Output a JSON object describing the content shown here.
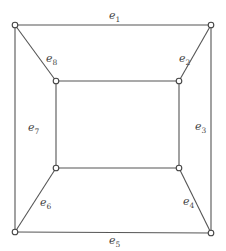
{
  "diagram": {
    "type": "graph",
    "vertices": [
      {
        "id": "outer-top-left",
        "x": 15,
        "y": 25
      },
      {
        "id": "outer-top-right",
        "x": 211,
        "y": 25
      },
      {
        "id": "outer-bottom-right",
        "x": 211,
        "y": 233
      },
      {
        "id": "outer-bottom-left",
        "x": 15,
        "y": 232
      },
      {
        "id": "inner-top-left",
        "x": 56,
        "y": 81
      },
      {
        "id": "inner-top-right",
        "x": 179,
        "y": 81
      },
      {
        "id": "inner-bottom-right",
        "x": 179,
        "y": 168
      },
      {
        "id": "inner-bottom-left",
        "x": 56,
        "y": 168
      }
    ],
    "edges": [
      {
        "label_base": "e",
        "label_sub": "1",
        "from": "outer-top-left",
        "to": "outer-top-right"
      },
      {
        "label_base": "e",
        "label_sub": "2",
        "from": "outer-top-right",
        "to": "inner-top-right"
      },
      {
        "label_base": "e",
        "label_sub": "3",
        "from": "outer-top-right",
        "to": "outer-bottom-right"
      },
      {
        "label_base": "e",
        "label_sub": "4",
        "from": "inner-bottom-right",
        "to": "outer-bottom-right"
      },
      {
        "label_base": "e",
        "label_sub": "5",
        "from": "outer-bottom-left",
        "to": "outer-bottom-right"
      },
      {
        "label_base": "e",
        "label_sub": "6",
        "from": "inner-bottom-left",
        "to": "outer-bottom-left"
      },
      {
        "label_base": "e",
        "label_sub": "7",
        "from": "outer-top-left",
        "to": "outer-bottom-left"
      },
      {
        "label_base": "e",
        "label_sub": "8",
        "from": "outer-top-left",
        "to": "inner-top-left"
      }
    ],
    "unlabeled_edges": [
      {
        "from": "inner-top-left",
        "to": "inner-top-right"
      },
      {
        "from": "inner-top-right",
        "to": "inner-bottom-right"
      },
      {
        "from": "inner-bottom-right",
        "to": "inner-bottom-left"
      },
      {
        "from": "inner-bottom-left",
        "to": "inner-top-left"
      }
    ],
    "labels": {
      "e1": {
        "base": "e",
        "sub": "1"
      },
      "e2": {
        "base": "e",
        "sub": "2"
      },
      "e3": {
        "base": "e",
        "sub": "3"
      },
      "e4": {
        "base": "e",
        "sub": "4"
      },
      "e5": {
        "base": "e",
        "sub": "5"
      },
      "e6": {
        "base": "e",
        "sub": "6"
      },
      "e7": {
        "base": "e",
        "sub": "7"
      },
      "e8": {
        "base": "e",
        "sub": "8"
      }
    }
  }
}
